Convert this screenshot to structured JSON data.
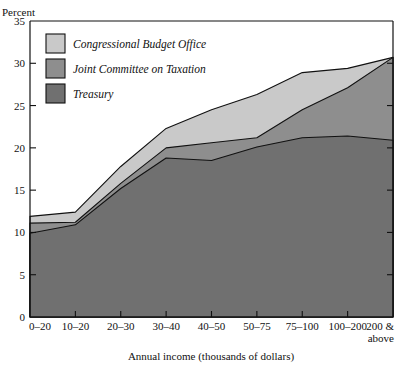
{
  "chart_data": {
    "type": "area",
    "title": "",
    "ylabel": "Percent",
    "xlabel": "Annual income (thousands of dollars)",
    "categories": [
      "0–20",
      "10–20",
      "20–30",
      "30–40",
      "40–50",
      "50–75",
      "75–100",
      "100–200",
      "200 &\nabove"
    ],
    "category_labels": [
      {
        "line1": "0–20",
        "line2": ""
      },
      {
        "line1": "10–20",
        "line2": ""
      },
      {
        "line1": "20–30",
        "line2": ""
      },
      {
        "line1": "30–40",
        "line2": ""
      },
      {
        "line1": "40–50",
        "line2": ""
      },
      {
        "line1": "50–75",
        "line2": ""
      },
      {
        "line1": "75–100",
        "line2": ""
      },
      {
        "line1": "100–200",
        "line2": ""
      },
      {
        "line1": "200 &",
        "line2": "above"
      }
    ],
    "ylim": [
      0,
      35
    ],
    "yticks": [
      0,
      5,
      10,
      15,
      20,
      25,
      30,
      35
    ],
    "ytick_labels": [
      "0",
      "5",
      "10",
      "15",
      "20",
      "25",
      "30",
      "35"
    ],
    "grid": false,
    "legend_position": "top-left",
    "stacking": "overlaid",
    "series": [
      {
        "name": "Congressional Budget Office",
        "color": "#c9c9c9",
        "values": [
          11.9,
          12.4,
          17.8,
          22.3,
          24.5,
          26.3,
          28.9,
          29.4,
          30.7
        ]
      },
      {
        "name": "Joint Committee on Taxation",
        "color": "#8e8e8e",
        "values": [
          11.1,
          11.2,
          15.8,
          20.0,
          20.6,
          21.2,
          24.5,
          27.1,
          30.7
        ]
      },
      {
        "name": "Treasury",
        "color": "#707070",
        "values": [
          9.9,
          10.9,
          15.2,
          18.8,
          18.5,
          20.1,
          21.2,
          21.4,
          20.9
        ]
      }
    ]
  },
  "legend": {
    "items": [
      {
        "label": "Congressional Budget Office",
        "swatch_color": "#c9c9c9"
      },
      {
        "label": "Joint Committee on Taxation",
        "swatch_color": "#8e8e8e"
      },
      {
        "label": "Treasury",
        "swatch_color": "#707070"
      }
    ]
  },
  "axes": {
    "y_axis_title": "Percent",
    "x_axis_title": "Annual income (thousands of dollars)"
  }
}
